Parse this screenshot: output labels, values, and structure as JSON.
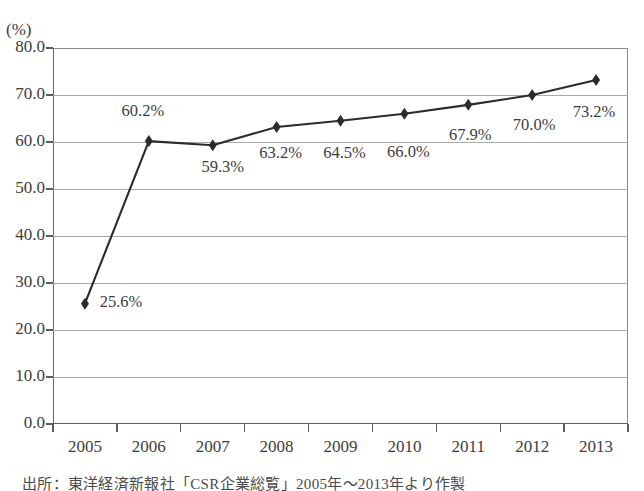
{
  "chart_data": {
    "type": "line",
    "title": "",
    "xlabel": "",
    "ylabel": "(%)",
    "yunit": "(%)",
    "categories": [
      "2005",
      "2006",
      "2007",
      "2008",
      "2009",
      "2010",
      "2011",
      "2012",
      "2013"
    ],
    "values": [
      25.6,
      60.2,
      59.3,
      63.2,
      64.5,
      66.0,
      67.9,
      70.0,
      73.2
    ],
    "point_labels": [
      "25.6%",
      "60.2%",
      "59.3%",
      "63.2%",
      "64.5%",
      "66.0%",
      "67.9%",
      "70.0%",
      "73.2%"
    ],
    "ylim": [
      0.0,
      80.0
    ],
    "ytick_values": [
      0.0,
      10.0,
      20.0,
      30.0,
      40.0,
      50.0,
      60.0,
      70.0,
      80.0
    ],
    "ytick_labels": [
      "0.0",
      "10.0",
      "20.0",
      "30.0",
      "40.0",
      "50.0",
      "60.0",
      "70.0",
      "80.0"
    ],
    "grid": true,
    "legend": "none",
    "series_color": "#2b2b2b",
    "grid_color": "#a9a9a9",
    "axis_color": "#5d5d5d",
    "marker": "diamond"
  },
  "source": {
    "note": "出所：東洋経済新報社「CSR企業総覧」2005年～2013年より作製"
  }
}
